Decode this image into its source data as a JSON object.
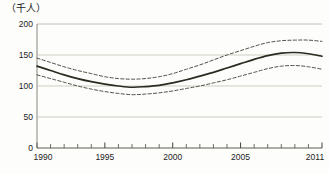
{
  "chart_data": {
    "type": "line",
    "title": "",
    "subtitle": "",
    "xlabel": "",
    "ylabel": "",
    "unit_label": "（千人）",
    "xlim": [
      1990,
      2011
    ],
    "ylim": [
      0,
      200
    ],
    "ytick_labels": [
      "0",
      "50",
      "100",
      "150",
      "200"
    ],
    "ytick_values": [
      0,
      50,
      100,
      150,
      200
    ],
    "xtick_labels": [
      "1990",
      "1995",
      "2000",
      "2005",
      "2011"
    ],
    "xtick_values": [
      1990,
      1995,
      2000,
      2005,
      2011
    ],
    "xtick_minor_values": [
      1991,
      1992,
      1993,
      1994,
      1996,
      1997,
      1998,
      1999,
      2001,
      2002,
      2003,
      2004,
      2006,
      2007,
      2008,
      2009,
      2010
    ],
    "grid": true,
    "grid_color": "#b9b9ae",
    "legend": "none",
    "x": [
      1990,
      1991,
      1992,
      1993,
      1994,
      1995,
      1996,
      1997,
      1998,
      1999,
      2000,
      2001,
      2002,
      2003,
      2004,
      2005,
      2006,
      2007,
      2008,
      2009,
      2010,
      2011
    ],
    "series": [
      {
        "name": "upper-bound",
        "style": "dashed",
        "color": "#3c3c32",
        "values": [
          145,
          138,
          131,
          125,
          120,
          115,
          112,
          111,
          112,
          115,
          120,
          127,
          134,
          142,
          150,
          157,
          164,
          170,
          173,
          174,
          174,
          172
        ]
      },
      {
        "name": "central-estimate",
        "style": "solid",
        "color": "#2b2b22",
        "values": [
          132,
          125,
          118,
          112,
          107,
          103,
          100,
          98,
          99,
          101,
          105,
          110,
          116,
          122,
          129,
          136,
          143,
          149,
          153,
          154,
          152,
          148
        ]
      },
      {
        "name": "lower-bound",
        "style": "dashed",
        "color": "#3c3c32",
        "values": [
          118,
          112,
          106,
          100,
          95,
          91,
          88,
          86,
          87,
          89,
          92,
          96,
          100,
          105,
          110,
          116,
          122,
          128,
          132,
          133,
          131,
          127
        ]
      }
    ]
  }
}
